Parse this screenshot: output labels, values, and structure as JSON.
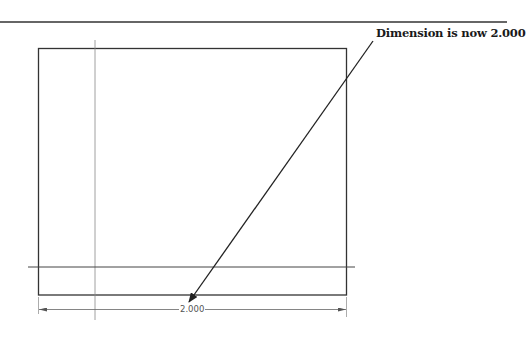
{
  "callout": {
    "text": "Dimension is now 2.000"
  },
  "dimension": {
    "value": "2.000"
  },
  "colors": {
    "outline": "#333333",
    "thin_line": "#777777",
    "text": "#1a1a1a"
  }
}
